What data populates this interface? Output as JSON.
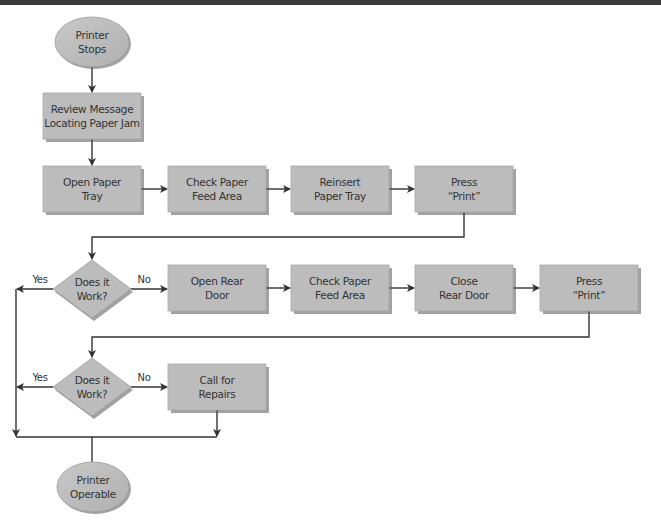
{
  "diagram": {
    "type": "flowchart",
    "colors": {
      "shape_fill": "#bcbcbc",
      "shape_shadow": "#555555",
      "line": "#333333",
      "text": "#333333",
      "header_bar": "#3a3a3a"
    },
    "nodes": [
      {
        "id": "start",
        "shape": "oval",
        "lines": [
          "Printer",
          "Stops"
        ]
      },
      {
        "id": "review",
        "shape": "rect",
        "lines": [
          "Review Message",
          "Locating Paper Jam"
        ]
      },
      {
        "id": "open_tray",
        "shape": "rect",
        "lines": [
          "Open Paper",
          "Tray"
        ]
      },
      {
        "id": "check_feed_1",
        "shape": "rect",
        "lines": [
          "Check Paper",
          "Feed Area"
        ]
      },
      {
        "id": "reinsert_tray",
        "shape": "rect",
        "lines": [
          "Reinsert",
          "Paper Tray"
        ]
      },
      {
        "id": "press_print_1",
        "shape": "rect",
        "lines": [
          "Press",
          "“Print”"
        ]
      },
      {
        "id": "decision_1",
        "shape": "diamond",
        "lines": [
          "Does it",
          "Work?"
        ]
      },
      {
        "id": "open_rear",
        "shape": "rect",
        "lines": [
          "Open Rear",
          "Door"
        ]
      },
      {
        "id": "check_feed_2",
        "shape": "rect",
        "lines": [
          "Check Paper",
          "Feed Area"
        ]
      },
      {
        "id": "close_rear",
        "shape": "rect",
        "lines": [
          "Close",
          "Rear Door"
        ]
      },
      {
        "id": "press_print_2",
        "shape": "rect",
        "lines": [
          "Press",
          "“Print”"
        ]
      },
      {
        "id": "decision_2",
        "shape": "diamond",
        "lines": [
          "Does it",
          "Work?"
        ]
      },
      {
        "id": "call_repairs",
        "shape": "rect",
        "lines": [
          "Call for",
          "Repairs"
        ]
      },
      {
        "id": "end",
        "shape": "oval",
        "lines": [
          "Printer",
          "Operable"
        ]
      }
    ],
    "edges": [
      {
        "from": "start",
        "to": "review",
        "label": ""
      },
      {
        "from": "review",
        "to": "open_tray",
        "label": ""
      },
      {
        "from": "open_tray",
        "to": "check_feed_1",
        "label": ""
      },
      {
        "from": "check_feed_1",
        "to": "reinsert_tray",
        "label": ""
      },
      {
        "from": "reinsert_tray",
        "to": "press_print_1",
        "label": ""
      },
      {
        "from": "press_print_1",
        "to": "decision_1",
        "label": ""
      },
      {
        "from": "decision_1",
        "to": "open_rear",
        "label": "No"
      },
      {
        "from": "decision_1",
        "to": "end",
        "label": "Yes"
      },
      {
        "from": "open_rear",
        "to": "check_feed_2",
        "label": ""
      },
      {
        "from": "check_feed_2",
        "to": "close_rear",
        "label": ""
      },
      {
        "from": "close_rear",
        "to": "press_print_2",
        "label": ""
      },
      {
        "from": "press_print_2",
        "to": "decision_2",
        "label": ""
      },
      {
        "from": "decision_2",
        "to": "call_repairs",
        "label": "No"
      },
      {
        "from": "decision_2",
        "to": "end",
        "label": "Yes"
      },
      {
        "from": "call_repairs",
        "to": "end",
        "label": ""
      }
    ]
  }
}
